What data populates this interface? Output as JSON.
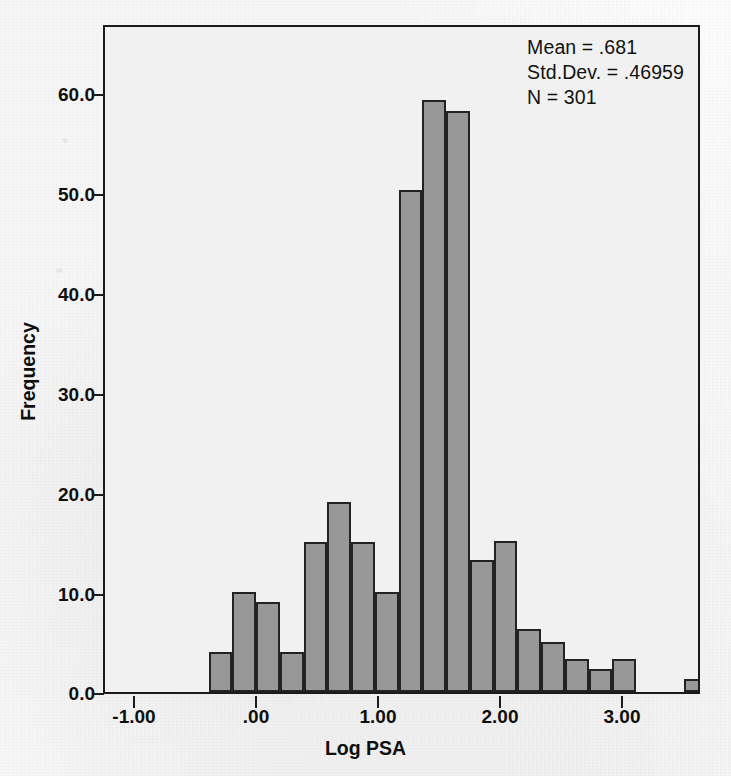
{
  "chart_data": {
    "type": "bar",
    "subtype": "histogram",
    "title": "",
    "xlabel": "Log PSA",
    "ylabel": "Frequency",
    "xlim": [
      -1.45,
      3.45
    ],
    "ylim": [
      0.0,
      67.0
    ],
    "grid": false,
    "legend": null,
    "bin_width": 0.195,
    "xticks": [
      "-1.00",
      ".00",
      "1.00",
      "2.00",
      "3.00"
    ],
    "xtick_values": [
      -1.0,
      0.0,
      1.0,
      2.0,
      3.0
    ],
    "yticks": [
      "0.0",
      "10.0",
      "20.0",
      "30.0",
      "40.0",
      "50.0",
      "60.0"
    ],
    "ytick_values": [
      0,
      10,
      20,
      30,
      40,
      50,
      60
    ],
    "bin_centers": [
      -0.5,
      -0.3,
      -0.11,
      0.09,
      0.28,
      0.48,
      0.67,
      0.87,
      1.06,
      1.26,
      1.45,
      1.65,
      1.84,
      2.33
    ],
    "bin_left_edges": [
      -0.6,
      -0.4,
      -0.21,
      -0.01,
      0.18,
      0.38,
      0.57,
      0.77,
      0.96,
      1.16,
      1.35,
      1.55,
      1.74,
      2.23
    ],
    "values": [
      4,
      10,
      9,
      4,
      15,
      19,
      15,
      10,
      50.3,
      59.3,
      58.2,
      13.2,
      15.1,
      6.3,
      5,
      3.3,
      2.3,
      3.3,
      1.3
    ],
    "bars": [
      {
        "x0": -0.6,
        "x1": -0.405,
        "freq": 4
      },
      {
        "x0": -0.405,
        "x1": -0.21,
        "freq": 10
      },
      {
        "x0": -0.21,
        "x1": -0.015,
        "freq": 9
      },
      {
        "x0": -0.015,
        "x1": 0.18,
        "freq": 4
      },
      {
        "x0": 0.18,
        "x1": 0.375,
        "freq": 15
      },
      {
        "x0": 0.375,
        "x1": 0.57,
        "freq": 19
      },
      {
        "x0": 0.57,
        "x1": 0.765,
        "freq": 15
      },
      {
        "x0": 0.765,
        "x1": 0.96,
        "freq": 10
      },
      {
        "x0": 0.96,
        "x1": 1.155,
        "freq": 50.3
      },
      {
        "x0": 1.155,
        "x1": 1.35,
        "freq": 59.3
      },
      {
        "x0": 1.35,
        "x1": 1.545,
        "freq": 58.2
      },
      {
        "x0": 1.545,
        "x1": 1.74,
        "freq": 13.2
      },
      {
        "x0": 1.74,
        "x1": 1.935,
        "freq": 15.1
      },
      {
        "x0": 1.935,
        "x1": 2.13,
        "freq": 6.3
      },
      {
        "x0": 2.13,
        "x1": 2.325,
        "freq": 5
      },
      {
        "x0": 2.325,
        "x1": 2.52,
        "freq": 3.3
      },
      {
        "x0": 2.52,
        "x1": 2.715,
        "freq": 2.3
      },
      {
        "x0": 2.715,
        "x1": 2.91,
        "freq": 3.3
      },
      {
        "x0": 3.3,
        "x1": 3.495,
        "freq": 1.3
      }
    ],
    "annotations": {
      "mean_label": "Mean = .681",
      "stddev_label": "Std.Dev. = .46959",
      "n_label": "N = 301",
      "mean": 0.681,
      "std_dev": 0.46959,
      "n": 301
    },
    "colors": {
      "bar_fill": "#989898",
      "bar_edge": "#232323",
      "plot_background": "#f1f1f1",
      "frame": "#1b1b1b",
      "text": "#0f0f0f"
    }
  }
}
